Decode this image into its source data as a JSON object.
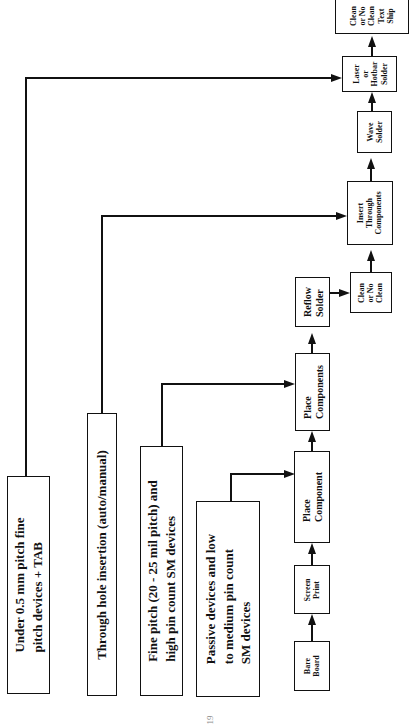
{
  "diagram": {
    "type": "flowchart",
    "orientation": "rotated-90-ccw",
    "categories": [
      {
        "id": "fine-pitch-tab",
        "lines": [
          "Under 0.5 mm  pitch fine",
          "pitch devices + TAB"
        ],
        "feeds": "laser-hotbar"
      },
      {
        "id": "through-hole",
        "lines": [
          "Through hole insertion (auto/manual)"
        ],
        "feeds": "insert-through"
      },
      {
        "id": "fine-pitch-sm",
        "lines": [
          "Fine pitch (20 - 25 mil pitch) and",
          "high pin count SM devices"
        ],
        "feeds": "place-components"
      },
      {
        "id": "passive",
        "lines": [
          "Passive devices and low",
          "to medium pin count",
          "SM devices"
        ],
        "feeds": "place-component"
      }
    ],
    "process_steps": [
      {
        "id": "bare-board",
        "lines": [
          "Bare",
          "Board"
        ]
      },
      {
        "id": "screen-print",
        "lines": [
          "Screen",
          "Print"
        ]
      },
      {
        "id": "place-component",
        "lines": [
          "Place",
          "Component"
        ]
      },
      {
        "id": "place-components",
        "lines": [
          "Place",
          "Components"
        ]
      },
      {
        "id": "reflow-solder",
        "lines": [
          "Reflow",
          "Solder"
        ]
      },
      {
        "id": "clean-1",
        "lines": [
          "Clean",
          "or No",
          "Clean"
        ]
      },
      {
        "id": "insert-through",
        "lines": [
          "Insert",
          "Through",
          "Components"
        ]
      },
      {
        "id": "wave-solder",
        "lines": [
          "Wave",
          "Solder"
        ]
      },
      {
        "id": "laser-hotbar",
        "lines": [
          "Laser",
          "or",
          "Hotbar",
          "Solder"
        ]
      },
      {
        "id": "clean-test-ship",
        "lines": [
          "Clean",
          "or No",
          "Clean",
          "Text",
          "Ship"
        ]
      }
    ],
    "flow": [
      "bare-board",
      "screen-print",
      "place-component",
      "place-components",
      "reflow-solder",
      "clean-1",
      "insert-through",
      "wave-solder",
      "laser-hotbar",
      "clean-test-ship"
    ]
  },
  "page_number": "19"
}
